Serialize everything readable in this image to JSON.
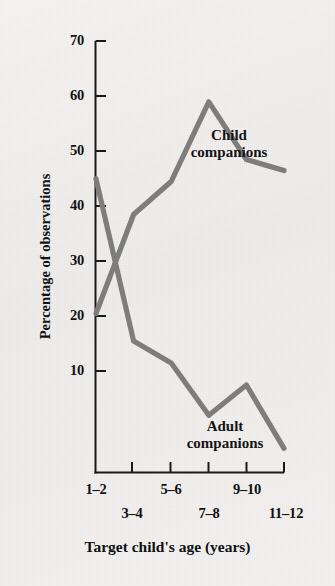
{
  "figure": {
    "background_color": "#f2f1ef",
    "line_color": "#7d7d7d",
    "axis_color": "#1a1a1a"
  },
  "axes": {
    "y_title": "Percentage of observations",
    "x_title": "Target child's age (years)",
    "y_ticks": [
      "70",
      "60",
      "50",
      "40",
      "30",
      "20",
      "10"
    ],
    "x_ticks": [
      "1–2",
      "3–4",
      "5–6",
      "7–8",
      "9–10",
      "11–12"
    ]
  },
  "annotations": {
    "child": {
      "line1": "Child",
      "line2": "companions"
    },
    "adult": {
      "line1": "Adult",
      "line2": "companions"
    }
  },
  "chart_data": {
    "type": "line",
    "title": "",
    "xlabel": "Target child's age (years)",
    "ylabel": "Percentage of observations",
    "categories": [
      "1–2",
      "3–4",
      "5–6",
      "7–8",
      "9–10",
      "11–12"
    ],
    "ylim": [
      0,
      70
    ],
    "xlim_categories": 6,
    "y_ticks": [
      10,
      20,
      30,
      40,
      50,
      60,
      70
    ],
    "grid": false,
    "legend": "inline-annotations",
    "series": [
      {
        "name": "Child companions",
        "color": "#7d7d7d",
        "values": [
          29,
          47,
          53,
          67.5,
          57,
          55
        ]
      },
      {
        "name": "Adult companions",
        "color": "#7d7d7d",
        "values": [
          53.5,
          24,
          20,
          10.5,
          16,
          4.5
        ]
      }
    ]
  }
}
